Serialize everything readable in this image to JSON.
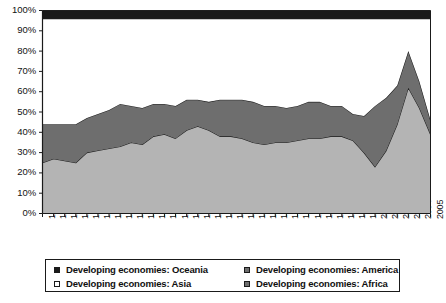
{
  "chart_data": {
    "type": "area",
    "stacked": true,
    "title": "",
    "subtitle": "",
    "xlabel": "",
    "ylabel": "",
    "ylim": [
      0,
      100
    ],
    "ytick_labels": [
      "0%",
      "10%",
      "20%",
      "30%",
      "40%",
      "50%",
      "60%",
      "70%",
      "80%",
      "90%",
      "100%"
    ],
    "ytick_values": [
      0,
      10,
      20,
      30,
      40,
      50,
      60,
      70,
      80,
      90,
      100
    ],
    "grid": false,
    "legend_position": "bottom",
    "categories": [
      "1970",
      "1971",
      "1972",
      "1973",
      "1974",
      "1975",
      "1976",
      "1977",
      "1978",
      "1979",
      "1980",
      "1981",
      "1982",
      "1983",
      "1984",
      "1985",
      "1986",
      "1987",
      "1988",
      "1989",
      "1990",
      "1991",
      "1992",
      "1993",
      "1994",
      "1995",
      "1996",
      "1997",
      "1998",
      "1999",
      "2000",
      "2001",
      "2002",
      "2003",
      "2004",
      "2005"
    ],
    "stack_order": [
      "Developing economies: Asia",
      "Developing economies: America",
      "Developing economies: Africa",
      "Developing economies: Oceania"
    ],
    "series": [
      {
        "name": "Developing economies: Asia",
        "color": "#b4b4b4",
        "legend_marker": "open-square",
        "values": [
          25,
          27,
          26,
          25,
          30,
          31,
          32,
          33,
          35,
          34,
          38,
          39,
          37,
          41,
          43,
          41,
          38,
          38,
          37,
          35,
          34,
          35,
          35,
          36,
          37,
          37,
          38,
          38,
          36,
          30,
          23,
          31,
          44,
          62,
          52,
          39
        ]
      },
      {
        "name": "Developing economies: America",
        "color": "#6e6e6e",
        "legend_marker": "filled-square-gray",
        "values": [
          19,
          17,
          18,
          19,
          17,
          18,
          19,
          21,
          18,
          18,
          16,
          15,
          16,
          15,
          13,
          14,
          18,
          18,
          19,
          20,
          19,
          18,
          17,
          17,
          18,
          18,
          15,
          15,
          13,
          18,
          30,
          26,
          19,
          18,
          13,
          7
        ]
      },
      {
        "name": "Developing economies: Africa",
        "color": "#ffffff",
        "legend_marker": "filled-square-gray",
        "values": [
          52,
          52,
          52,
          52,
          49,
          47,
          45,
          42,
          43,
          44,
          42,
          42,
          43,
          40,
          40,
          41,
          40,
          40,
          40,
          41,
          43,
          43,
          44,
          43,
          41,
          41,
          43,
          43,
          47,
          48,
          43,
          39,
          33,
          16,
          31,
          50
        ]
      },
      {
        "name": "Developing economies: Oceania",
        "color": "#1a1a1a",
        "legend_marker": "filled-square-black",
        "values": [
          4,
          4,
          4,
          4,
          4,
          4,
          4,
          4,
          4,
          4,
          4,
          4,
          4,
          4,
          4,
          4,
          4,
          4,
          4,
          4,
          4,
          4,
          4,
          4,
          4,
          4,
          4,
          4,
          4,
          4,
          4,
          4,
          4,
          4,
          4,
          4
        ]
      }
    ]
  },
  "legend": {
    "entries": [
      {
        "label": "Developing economies: Oceania",
        "column": "left"
      },
      {
        "label": "Developing economies: Asia",
        "column": "left"
      },
      {
        "label": "Developing economies: America",
        "column": "right"
      },
      {
        "label": "Developing economies: Africa",
        "column": "right"
      }
    ]
  },
  "colors": {
    "asia": "#b4b4b4",
    "america": "#6e6e6e",
    "africa": "#ffffff",
    "oceania": "#1a1a1a",
    "axis": "#1a1a1a",
    "text": "#121212"
  }
}
